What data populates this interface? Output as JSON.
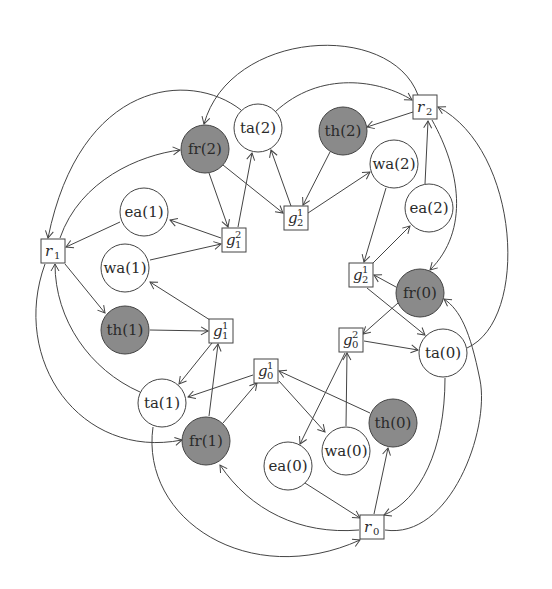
{
  "diagram": {
    "colors": {
      "background": "#ffffff",
      "stroke": "#444444",
      "shaded_node": "#8a8a8a",
      "plain_node": "#ffffff",
      "text": "#2a2a2a"
    },
    "circle_nodes": [
      {
        "id": "fr2",
        "label": "fr(2)",
        "x": 205,
        "y": 149,
        "shaded": true
      },
      {
        "id": "ta2",
        "label": "ta(2)",
        "x": 258,
        "y": 128,
        "shaded": false
      },
      {
        "id": "th2",
        "label": "th(2)",
        "x": 343,
        "y": 131,
        "shaded": true
      },
      {
        "id": "wa2",
        "label": "wa(2)",
        "x": 394,
        "y": 164,
        "shaded": false
      },
      {
        "id": "ea2",
        "label": "ea(2)",
        "x": 429,
        "y": 208,
        "shaded": false
      },
      {
        "id": "fr0",
        "label": "fr(0)",
        "x": 420,
        "y": 293,
        "shaded": true
      },
      {
        "id": "ta0",
        "label": "ta(0)",
        "x": 443,
        "y": 353,
        "shaded": false
      },
      {
        "id": "th0",
        "label": "th(0)",
        "x": 393,
        "y": 423,
        "shaded": true
      },
      {
        "id": "wa0",
        "label": "wa(0)",
        "x": 346,
        "y": 451,
        "shaded": false
      },
      {
        "id": "ea0",
        "label": "ea(0)",
        "x": 288,
        "y": 466,
        "shaded": false
      },
      {
        "id": "fr1",
        "label": "fr(1)",
        "x": 206,
        "y": 441,
        "shaded": true
      },
      {
        "id": "ta1",
        "label": "ta(1)",
        "x": 162,
        "y": 403,
        "shaded": false
      },
      {
        "id": "th1",
        "label": "th(1)",
        "x": 125,
        "y": 330,
        "shaded": true
      },
      {
        "id": "wa1",
        "label": "wa(1)",
        "x": 125,
        "y": 268,
        "shaded": false
      },
      {
        "id": "ea1",
        "label": "ea(1)",
        "x": 144,
        "y": 212,
        "shaded": false
      }
    ],
    "square_nodes": [
      {
        "id": "r2",
        "base": "r",
        "sub": "2",
        "sup": "",
        "x": 425,
        "y": 107
      },
      {
        "id": "r1",
        "base": "r",
        "sub": "1",
        "sup": "",
        "x": 53,
        "y": 251
      },
      {
        "id": "r0",
        "base": "r",
        "sub": "0",
        "sup": "",
        "x": 372,
        "y": 527
      },
      {
        "id": "g12",
        "base": "g",
        "sub": "1",
        "sup": "2",
        "x": 234,
        "y": 240
      },
      {
        "id": "g21a",
        "base": "g",
        "sub": "2",
        "sup": "1",
        "x": 296,
        "y": 218
      },
      {
        "id": "g21b",
        "base": "g",
        "sub": "2",
        "sup": "1",
        "x": 361,
        "y": 275
      },
      {
        "id": "g02",
        "base": "g",
        "sub": "0",
        "sup": "2",
        "x": 351,
        "y": 340
      },
      {
        "id": "g01",
        "base": "g",
        "sub": "0",
        "sup": "1",
        "x": 266,
        "y": 371
      },
      {
        "id": "g11",
        "base": "g",
        "sub": "1",
        "sup": "1",
        "x": 221,
        "y": 331
      }
    ],
    "edges": [
      {
        "from": "ta2",
        "to": "r1",
        "path": "M241,110 C190,70 80,80 48,238"
      },
      {
        "from": "r2",
        "to": "fr2",
        "path": "M418,95 C390,20 230,30 204,124"
      },
      {
        "from": "r1",
        "to": "fr2",
        "path": "M60,238 C80,180 140,155 180,150"
      },
      {
        "from": "ta2",
        "to": "r2",
        "path": "M275,112 C320,70 380,80 412,100"
      },
      {
        "from": "r2",
        "to": "th2",
        "path": "M413,112 L367,127"
      },
      {
        "from": "r2",
        "to": "fr0",
        "path": "M432,120 C460,170 470,230 430,270"
      },
      {
        "from": "ta0",
        "to": "r2",
        "path": "M467,348 C530,320 520,150 438,107"
      },
      {
        "from": "ea2",
        "to": "r2",
        "path": "M425,184 L428,121"
      },
      {
        "from": "th2",
        "to": "g21a",
        "path": "M330,152 L303,205"
      },
      {
        "from": "g21a",
        "to": "ta2",
        "path": "M291,206 L271,150"
      },
      {
        "from": "g21a",
        "to": "wa2",
        "path": "M308,213 L370,172"
      },
      {
        "from": "fr2",
        "to": "g21a",
        "path": "M223,165 L283,213"
      },
      {
        "from": "fr2",
        "to": "g12",
        "path": "M209,173 L228,227"
      },
      {
        "from": "g12",
        "to": "ta2",
        "path": "M238,227 L252,153"
      },
      {
        "from": "g12",
        "to": "ea1",
        "path": "M221,238 L170,220"
      },
      {
        "from": "wa1",
        "to": "g12",
        "path": "M150,260 L221,244"
      },
      {
        "from": "ea1",
        "to": "r1",
        "path": "M120,222 L66,247"
      },
      {
        "from": "r1",
        "to": "th1",
        "path": "M65,264 L105,313"
      },
      {
        "from": "th1",
        "to": "g11",
        "path": "M150,330 L208,331"
      },
      {
        "from": "g11",
        "to": "wa1",
        "path": "M210,320 L150,282"
      },
      {
        "from": "g11",
        "to": "ta1",
        "path": "M212,343 L179,384"
      },
      {
        "from": "fr1",
        "to": "g11",
        "path": "M209,416 L218,344"
      },
      {
        "from": "ta1",
        "to": "r1",
        "path": "M140,392 C90,370 55,320 55,264"
      },
      {
        "from": "r1",
        "to": "fr1",
        "path": "M45,264 C10,360 80,460 182,440"
      },
      {
        "from": "ta1",
        "to": "r0",
        "path": "M153,427 C140,520 250,590 360,540"
      },
      {
        "from": "g01",
        "to": "ta1",
        "path": "M253,375 L188,397"
      },
      {
        "from": "fr1",
        "to": "g01",
        "path": "M223,423 L257,383"
      },
      {
        "from": "g01",
        "to": "wa0",
        "path": "M279,381 L325,432"
      },
      {
        "from": "th0",
        "to": "g01",
        "path": "M370,413 L279,371"
      },
      {
        "from": "g02",
        "to": "ea0",
        "path": "M345,353 L300,444"
      },
      {
        "from": "wa0",
        "to": "g02",
        "path": "M346,426 L347,353"
      },
      {
        "from": "g02",
        "to": "ta0",
        "path": "M364,341 L418,350"
      },
      {
        "from": "fr0",
        "to": "g02",
        "path": "M398,303 L363,334"
      },
      {
        "from": "fr0",
        "to": "g21b",
        "path": "M396,287 L374,275"
      },
      {
        "from": "g21b",
        "to": "ta0",
        "path": "M367,288 L425,335"
      },
      {
        "from": "wa2",
        "to": "g21b",
        "path": "M386,188 L364,262"
      },
      {
        "from": "g21b",
        "to": "ea2",
        "path": "M372,264 L410,226"
      },
      {
        "from": "ta0",
        "to": "r0",
        "path": "M445,378 C445,450 420,500 384,515"
      },
      {
        "from": "r0",
        "to": "th0",
        "path": "M374,514 L388,448"
      },
      {
        "from": "ea0",
        "to": "r0",
        "path": "M305,483 L360,518"
      },
      {
        "from": "r0",
        "to": "fr1",
        "path": "M359,530 C300,535 250,510 220,465"
      },
      {
        "from": "r0",
        "to": "fr0",
        "path": "M385,530 C450,540 490,430 480,380 C470,330 460,310 444,299"
      }
    ]
  }
}
